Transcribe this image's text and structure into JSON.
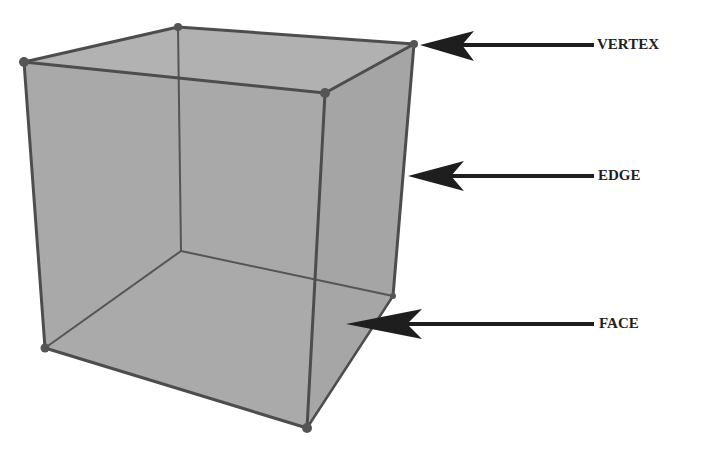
{
  "diagram": {
    "colors": {
      "face_fill": "#a3a3a3",
      "edge_stroke": "#4d4d4d",
      "vertex_fill": "#555555",
      "arrow": "#1e1e1e",
      "background": "#ffffff"
    },
    "vertices": {
      "top_back_left": [
        178,
        27
      ],
      "top_back_right": [
        414,
        44
      ],
      "top_front_left": [
        24,
        62
      ],
      "top_front_right": [
        325,
        93
      ],
      "bottom_front_left": [
        45,
        348
      ],
      "bottom_front_right": [
        307,
        428
      ],
      "bottom_back_left": [
        181,
        251
      ],
      "bottom_back_right": [
        393,
        296
      ]
    },
    "labels": [
      {
        "id": "vertex",
        "text": "VERTEX",
        "arrow_tip": [
          418,
          45
        ],
        "arrow_tail": [
          594,
          45
        ],
        "text_x": 597,
        "text_y": 36
      },
      {
        "id": "edge",
        "text": "EDGE",
        "arrow_tip": [
          409,
          176
        ],
        "arrow_tail": [
          594,
          176
        ],
        "text_x": 597,
        "text_y": 167
      },
      {
        "id": "face",
        "text": "FACE",
        "arrow_tip": [
          345,
          324
        ],
        "arrow_tail": [
          594,
          324
        ],
        "text_x": 598,
        "text_y": 315
      }
    ]
  }
}
